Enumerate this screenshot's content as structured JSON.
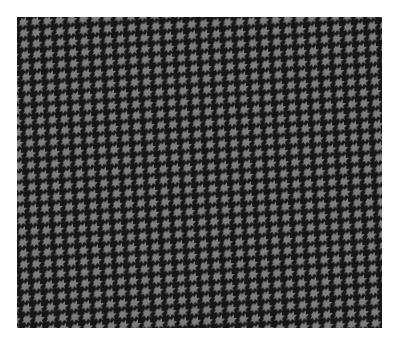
{
  "image": {
    "subject": "houndstooth-fabric-swatch",
    "colors": {
      "background": "#ffffff",
      "dark": "#161616",
      "light": "#7c7c7c"
    },
    "pattern": {
      "type": "houndstooth",
      "period_x": 12,
      "period_y": 11
    }
  }
}
